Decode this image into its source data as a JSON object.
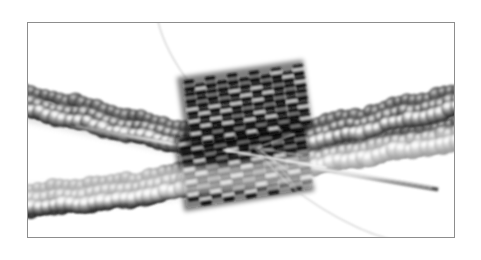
{
  "page": {
    "background_color": "#ffffff",
    "width": 481,
    "height": 260
  },
  "figure": {
    "name": "beadwork-photograph",
    "kind": "photograph",
    "color_mode": "grayscale",
    "caption": "",
    "frame": {
      "border_color": "#8d8d8d",
      "border_width_px": 1,
      "x": 27,
      "y": 22,
      "width": 428,
      "height": 216,
      "background_color": "#ffffff"
    },
    "subject": {
      "description": "Two strands of round seed beads crossing behind two woven cylinder-bead bands, joined at the center, with a beading needle and thread passing through",
      "elements": [
        {
          "name": "upper-bead-strand",
          "bead_type": "round seed beads",
          "orientation": "descends left to right then rises",
          "tone": "mid gray with bright highlights"
        },
        {
          "name": "lower-bead-strand",
          "bead_type": "round seed beads",
          "orientation": "rises left to right",
          "tone": "mid gray with bright highlights"
        },
        {
          "name": "upper-cylinder-bead-band",
          "bead_type": "cylinder (delica) beads, peyote stitch",
          "tone": "very dark gray / near black with white glints"
        },
        {
          "name": "lower-cylinder-bead-band",
          "bead_type": "cylinder (delica) beads, peyote stitch",
          "tone": "very dark gray / near black with white glints"
        },
        {
          "name": "beading-needle",
          "tone": "light silver",
          "direction": "upper-left to lower-right diagonal"
        },
        {
          "name": "thread-upper",
          "tone": "pale gray",
          "path": "curves from top frame edge down to center"
        },
        {
          "name": "thread-lower",
          "tone": "pale gray",
          "path": "curves from center down to bottom-right frame edge"
        }
      ]
    },
    "palette": {
      "paper_white": "#ffffff",
      "frame_gray": "#8d8d8d",
      "bead_dark": "#1c1c1c",
      "bead_mid": "#6d6d6d",
      "bead_light": "#c9c9c9",
      "highlight": "#f2f2f2",
      "shadow": "#2a2a2a",
      "needle": "#e0e0e0",
      "thread": "#cfcfcf"
    }
  }
}
